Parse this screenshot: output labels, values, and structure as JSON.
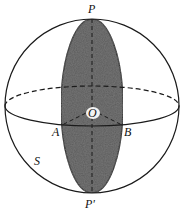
{
  "figure": {
    "type": "sphere-lune-diagram",
    "colors": {
      "stroke": "#1a1a1a",
      "lune_fill": "#5a5a5a",
      "background": "#ffffff"
    },
    "sphere": {
      "cx": 92,
      "cy": 106,
      "r": 87
    },
    "equator": {
      "rx": 87,
      "ry": 20
    },
    "lune": {
      "rx": 31,
      "ry": 87
    },
    "labels": {
      "top_pole": "P",
      "bottom_pole": "P'",
      "center": "O",
      "left_point": "A",
      "right_point": "B",
      "surface": "S"
    }
  }
}
